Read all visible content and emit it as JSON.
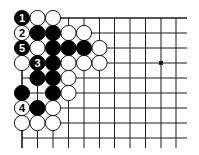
{
  "diagram": {
    "type": "go-board",
    "colors": {
      "line": "#1a1a1a",
      "black_stone": "#000000",
      "white_stone": "#ffffff",
      "background": "#ffffff"
    },
    "grid": {
      "columns_x": [
        22,
        37.5,
        53,
        68.5,
        84,
        99.5,
        114.5,
        130,
        145.5,
        161,
        176
      ],
      "rows_y": [
        18,
        33,
        48,
        63,
        78,
        93,
        108,
        123,
        138
      ],
      "extend_right_to": 187,
      "extend_bottom_to": 148,
      "top_edge": true,
      "left_edge": true
    },
    "hoshi": [
      {
        "col": 9,
        "row": 3
      }
    ],
    "stones": [
      {
        "col": 0,
        "row": 0,
        "color": "black",
        "label": "1"
      },
      {
        "col": 1,
        "row": 0,
        "color": "white",
        "label": ""
      },
      {
        "col": 2,
        "row": 0,
        "color": "white",
        "label": ""
      },
      {
        "col": 0,
        "row": 1,
        "color": "white",
        "label": "2"
      },
      {
        "col": 1,
        "row": 1,
        "color": "black",
        "label": ""
      },
      {
        "col": 2,
        "row": 1,
        "color": "black",
        "label": ""
      },
      {
        "col": 3,
        "row": 1,
        "color": "white",
        "label": ""
      },
      {
        "col": 4,
        "row": 1,
        "color": "white",
        "label": ""
      },
      {
        "col": 0,
        "row": 2,
        "color": "black",
        "label": "5"
      },
      {
        "col": 1,
        "row": 2,
        "color": "white",
        "label": ""
      },
      {
        "col": 2,
        "row": 2,
        "color": "black",
        "label": ""
      },
      {
        "col": 3,
        "row": 2,
        "color": "black",
        "label": ""
      },
      {
        "col": 4,
        "row": 2,
        "color": "black",
        "label": ""
      },
      {
        "col": 5,
        "row": 2,
        "color": "white",
        "label": ""
      },
      {
        "col": 0,
        "row": 3,
        "color": "white",
        "label": ""
      },
      {
        "col": 1,
        "row": 3,
        "color": "black",
        "label": "3"
      },
      {
        "col": 2,
        "row": 3,
        "color": "black",
        "label": ""
      },
      {
        "col": 3,
        "row": 3,
        "color": "white",
        "label": ""
      },
      {
        "col": 4,
        "row": 3,
        "color": "white",
        "label": ""
      },
      {
        "col": 5,
        "row": 3,
        "color": "white",
        "label": ""
      },
      {
        "col": 1,
        "row": 4,
        "color": "black",
        "label": ""
      },
      {
        "col": 2,
        "row": 4,
        "color": "black",
        "label": ""
      },
      {
        "col": 3,
        "row": 4,
        "color": "white",
        "label": ""
      },
      {
        "col": 0,
        "row": 5,
        "color": "black",
        "label": ""
      },
      {
        "col": 2,
        "row": 5,
        "color": "black",
        "label": ""
      },
      {
        "col": 3,
        "row": 5,
        "color": "white",
        "label": ""
      },
      {
        "col": 0,
        "row": 6,
        "color": "white",
        "label": "4"
      },
      {
        "col": 1,
        "row": 6,
        "color": "black",
        "label": ""
      },
      {
        "col": 2,
        "row": 6,
        "color": "white",
        "label": ""
      },
      {
        "col": 0,
        "row": 7,
        "color": "white",
        "label": ""
      },
      {
        "col": 1,
        "row": 7,
        "color": "white",
        "label": ""
      },
      {
        "col": 2,
        "row": 7,
        "color": "white",
        "label": ""
      }
    ],
    "stone_radius": 7.6
  }
}
